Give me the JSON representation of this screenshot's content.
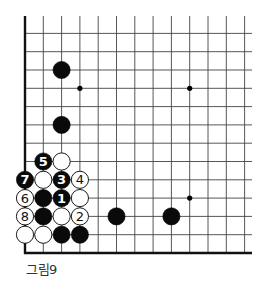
{
  "diagram": {
    "caption": "그림9",
    "grid": {
      "left_edge_x": 25,
      "bottom_edge_y": 253,
      "spacing": 18.3,
      "cols": 13,
      "rows": 13,
      "top_extend_y": 16,
      "right_extend_x": 252
    },
    "star_points": [
      {
        "col": 3,
        "row": 3
      },
      {
        "col": 9,
        "row": 3
      },
      {
        "col": 9,
        "row": 9
      }
    ],
    "stones": [
      {
        "color": "black",
        "col": 2,
        "row": 2,
        "label": ""
      },
      {
        "color": "black",
        "col": 2,
        "row": 5,
        "label": ""
      },
      {
        "color": "black",
        "col": 1,
        "row": 7,
        "label": "5"
      },
      {
        "color": "white",
        "col": 2,
        "row": 7,
        "label": ""
      },
      {
        "color": "black",
        "col": 0,
        "row": 8,
        "label": "7"
      },
      {
        "color": "white",
        "col": 1,
        "row": 8,
        "label": ""
      },
      {
        "color": "black",
        "col": 2,
        "row": 8,
        "label": "3"
      },
      {
        "color": "white",
        "col": 3,
        "row": 8,
        "label": "4"
      },
      {
        "color": "white",
        "col": 0,
        "row": 9,
        "label": "6"
      },
      {
        "color": "black",
        "col": 1,
        "row": 9,
        "label": ""
      },
      {
        "color": "black",
        "col": 2,
        "row": 9,
        "label": "1"
      },
      {
        "color": "white",
        "col": 3,
        "row": 9,
        "label": ""
      },
      {
        "color": "white",
        "col": 0,
        "row": 10,
        "label": "8"
      },
      {
        "color": "black",
        "col": 1,
        "row": 10,
        "label": ""
      },
      {
        "color": "white",
        "col": 2,
        "row": 10,
        "label": ""
      },
      {
        "color": "white",
        "col": 3,
        "row": 10,
        "label": "2"
      },
      {
        "color": "black",
        "col": 5,
        "row": 10,
        "label": ""
      },
      {
        "color": "black",
        "col": 8,
        "row": 10,
        "label": ""
      },
      {
        "color": "white",
        "col": 0,
        "row": 11,
        "label": ""
      },
      {
        "color": "white",
        "col": 1,
        "row": 11,
        "label": ""
      },
      {
        "color": "black",
        "col": 2,
        "row": 11,
        "label": ""
      },
      {
        "color": "black",
        "col": 3,
        "row": 11,
        "label": ""
      }
    ],
    "colors": {
      "line": "#444444",
      "edge": "#111111",
      "black_stone": "#0a0a0a",
      "white_stone": "#ffffff"
    }
  }
}
